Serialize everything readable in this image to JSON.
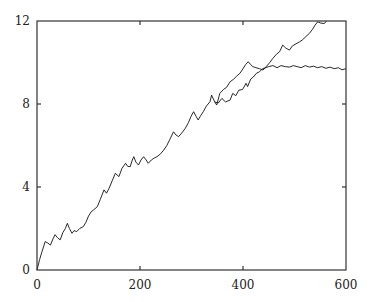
{
  "chart_data": {
    "type": "line",
    "title": "",
    "xlabel": "",
    "ylabel": "",
    "xlim": [
      0,
      600
    ],
    "ylim": [
      0,
      12
    ],
    "grid": false,
    "legend": null,
    "x_ticks": [
      0,
      200,
      400,
      600
    ],
    "y_ticks": [
      0,
      4,
      8,
      12
    ],
    "x_tick_labels": [
      "0",
      "200",
      "400",
      "600"
    ],
    "y_tick_labels": [
      "0",
      "4",
      "8",
      "12"
    ],
    "series": [
      {
        "name": "curve-rising",
        "points": [
          [
            0,
            0
          ],
          [
            5,
            0.5
          ],
          [
            10,
            0.9
          ],
          [
            16,
            1.37
          ],
          [
            21,
            1.3
          ],
          [
            26,
            1.2
          ],
          [
            31,
            1.5
          ],
          [
            35,
            1.7
          ],
          [
            40,
            1.55
          ],
          [
            45,
            1.45
          ],
          [
            50,
            1.8
          ],
          [
            55,
            2.0
          ],
          [
            59,
            2.25
          ],
          [
            63,
            2.0
          ],
          [
            68,
            1.77
          ],
          [
            72,
            1.9
          ],
          [
            77,
            1.85
          ],
          [
            83,
            2.0
          ],
          [
            90,
            2.09
          ],
          [
            95,
            2.3
          ],
          [
            100,
            2.6
          ],
          [
            105,
            2.8
          ],
          [
            110,
            2.9
          ],
          [
            117,
            3.05
          ],
          [
            123,
            3.4
          ],
          [
            130,
            3.86
          ],
          [
            135,
            3.7
          ],
          [
            140,
            3.94
          ],
          [
            146,
            4.3
          ],
          [
            152,
            4.66
          ],
          [
            159,
            4.5
          ],
          [
            165,
            4.9
          ],
          [
            172,
            5.14
          ],
          [
            176,
            5.0
          ],
          [
            181,
            4.98
          ],
          [
            185,
            5.3
          ],
          [
            188,
            5.46
          ],
          [
            192,
            5.2
          ],
          [
            197,
            5.06
          ],
          [
            202,
            5.3
          ],
          [
            207,
            5.46
          ],
          [
            212,
            5.3
          ],
          [
            216,
            5.14
          ],
          [
            222,
            5.3
          ],
          [
            228,
            5.4
          ],
          [
            233,
            5.46
          ],
          [
            240,
            5.6
          ],
          [
            246,
            5.78
          ],
          [
            252,
            6.0
          ],
          [
            258,
            6.3
          ],
          [
            265,
            6.66
          ],
          [
            270,
            6.5
          ],
          [
            275,
            6.43
          ],
          [
            281,
            6.6
          ],
          [
            288,
            6.83
          ],
          [
            294,
            7.1
          ],
          [
            299,
            7.4
          ],
          [
            304,
            7.63
          ],
          [
            309,
            7.4
          ],
          [
            313,
            7.23
          ],
          [
            318,
            7.45
          ],
          [
            323,
            7.63
          ],
          [
            329,
            7.9
          ],
          [
            336,
            8.11
          ],
          [
            339,
            8.43
          ],
          [
            345,
            8.1
          ],
          [
            349,
            7.95
          ],
          [
            355,
            8.51
          ],
          [
            362,
            8.7
          ],
          [
            368,
            8.8
          ],
          [
            375,
            9.07
          ],
          [
            382,
            9.2
          ],
          [
            388,
            9.35
          ],
          [
            394,
            9.48
          ],
          [
            400,
            9.7
          ],
          [
            405,
            9.9
          ],
          [
            410,
            10.04
          ],
          [
            415,
            9.9
          ],
          [
            419,
            9.8
          ],
          [
            425,
            9.75
          ],
          [
            432,
            9.7
          ],
          [
            439,
            9.64
          ],
          [
            445,
            9.8
          ],
          [
            452,
            10.0
          ],
          [
            458,
            10.2
          ],
          [
            465,
            10.4
          ],
          [
            471,
            10.52
          ],
          [
            477,
            10.84
          ],
          [
            483,
            10.7
          ],
          [
            490,
            10.6
          ],
          [
            496,
            10.8
          ],
          [
            503,
            10.9
          ],
          [
            510,
            11.0
          ],
          [
            516,
            11.1
          ],
          [
            522,
            11.25
          ],
          [
            529,
            11.4
          ],
          [
            535,
            11.6
          ],
          [
            540,
            11.8
          ],
          [
            545,
            11.96
          ],
          [
            551,
            11.9
          ],
          [
            558,
            11.88
          ],
          [
            562,
            12.0
          ]
        ]
      },
      {
        "name": "curve-saturating",
        "points": [
          [
            345,
            8.1
          ],
          [
            352,
            8.05
          ],
          [
            359,
            8.27
          ],
          [
            366,
            8.1
          ],
          [
            375,
            8.19
          ],
          [
            380,
            8.51
          ],
          [
            386,
            8.4
          ],
          [
            392,
            8.67
          ],
          [
            399,
            8.7
          ],
          [
            406,
            9.0
          ],
          [
            409,
            8.84
          ],
          [
            415,
            9.2
          ],
          [
            420,
            9.3
          ],
          [
            426,
            9.48
          ],
          [
            432,
            9.55
          ],
          [
            438,
            9.7
          ],
          [
            444,
            9.75
          ],
          [
            450,
            9.8
          ],
          [
            458,
            9.85
          ],
          [
            466,
            9.75
          ],
          [
            474,
            9.85
          ],
          [
            482,
            9.8
          ],
          [
            490,
            9.78
          ],
          [
            498,
            9.85
          ],
          [
            505,
            9.8
          ],
          [
            513,
            9.75
          ],
          [
            521,
            9.85
          ],
          [
            529,
            9.78
          ],
          [
            537,
            9.82
          ],
          [
            545,
            9.75
          ],
          [
            553,
            9.8
          ],
          [
            561,
            9.72
          ],
          [
            569,
            9.78
          ],
          [
            577,
            9.7
          ],
          [
            585,
            9.75
          ],
          [
            592,
            9.65
          ],
          [
            600,
            9.7
          ]
        ]
      }
    ]
  }
}
